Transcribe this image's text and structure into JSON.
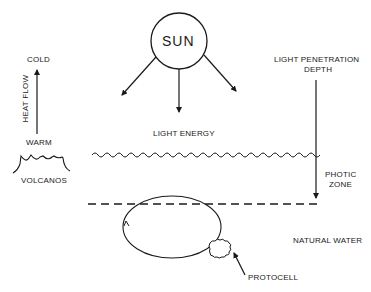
{
  "diagram": {
    "sun": {
      "label": "SUN"
    },
    "heat_flow": {
      "axis_label": "HEAT FLOW",
      "top_label": "COLD",
      "bottom_label": "WARM"
    },
    "volcanos": {
      "label": "VOLCANOS"
    },
    "light_energy": {
      "label": "LIGHT ENERGY"
    },
    "light_penetration": {
      "label_line1": "LIGHT PENETRATION",
      "label_line2": "DEPTH"
    },
    "photic_zone": {
      "label_line1": "PHOTIC",
      "label_line2": "ZONE"
    },
    "natural_water": {
      "label": "NATURAL WATER"
    },
    "protocell": {
      "label": "PROTOCELL"
    },
    "colors": {
      "ink": "#1a1a1a",
      "background": "#ffffff"
    }
  }
}
